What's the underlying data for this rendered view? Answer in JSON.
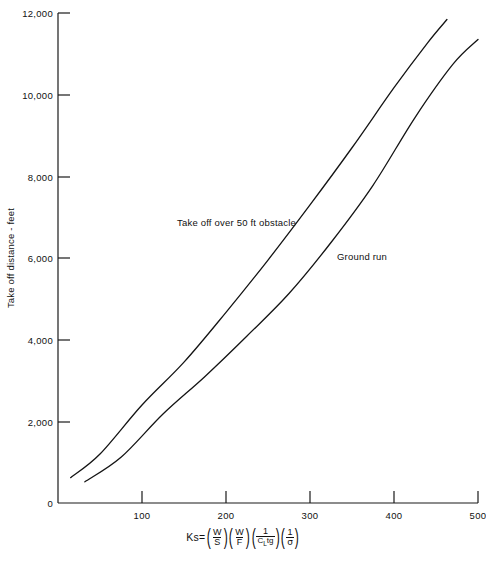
{
  "chart_data": {
    "type": "line",
    "title": "",
    "xlabel": "Ks=(W/S)(W/F)(1/C_L tg)(1/σ)",
    "ylabel": "Take off distance - feet",
    "xlim": [
      0,
      500
    ],
    "ylim": [
      0,
      12000
    ],
    "xticks": [
      100,
      200,
      300,
      400,
      500
    ],
    "xtick_labels": [
      "100",
      "200",
      "300",
      "400",
      "500"
    ],
    "yticks": [
      0,
      2000,
      4000,
      6000,
      8000,
      10000,
      12000
    ],
    "ytick_labels": [
      "0",
      "2,000",
      "4,000",
      "6,000",
      "8,000",
      "10,000",
      "12,000"
    ],
    "grid": false,
    "legend": "inline-annotations",
    "series": [
      {
        "name": "Take off over 50 ft obstacle",
        "x": [
          15,
          50,
          100,
          150,
          200,
          250,
          300,
          350,
          400,
          440,
          463
        ],
        "y": [
          620,
          1200,
          2400,
          3450,
          4670,
          5950,
          7300,
          8700,
          10170,
          11270,
          11840
        ]
      },
      {
        "name": "Ground run",
        "x": [
          32,
          75,
          125,
          175,
          225,
          275,
          325,
          375,
          425,
          470,
          500
        ],
        "y": [
          520,
          1120,
          2180,
          3100,
          4090,
          5130,
          6380,
          7780,
          9440,
          10740,
          11350
        ]
      }
    ],
    "annotations": [
      {
        "text": "Take off over 50 ft obstacle",
        "x_px": 177,
        "y_px": 226
      },
      {
        "text": "Ground run",
        "x_px": 337,
        "y_px": 260
      }
    ]
  },
  "axes": {
    "y_axis_label": "Take off distance - feet",
    "y_ticks": [
      "12,000",
      "10,000",
      "8,000",
      "6,000",
      "4,000",
      "2,000",
      "0"
    ],
    "x_ticks": [
      "100",
      "200",
      "300",
      "400",
      "500"
    ]
  },
  "curve_labels": {
    "obstacle": "Take off over 50 ft obstacle",
    "ground_run": "Ground run"
  },
  "formula": {
    "lead": "Ks=",
    "term1_num": "W",
    "term1_den": "S",
    "term2_num": "W",
    "term2_den": "F",
    "term3_num": "1",
    "term3_den_c": "C",
    "term3_den_sub": "L",
    "term3_den_tail": "tg",
    "term4_num": "1",
    "term4_den": "σ",
    "paren_open": "(",
    "paren_close": ")"
  },
  "colors": {
    "ink": "#141414",
    "background": "#ffffff"
  }
}
